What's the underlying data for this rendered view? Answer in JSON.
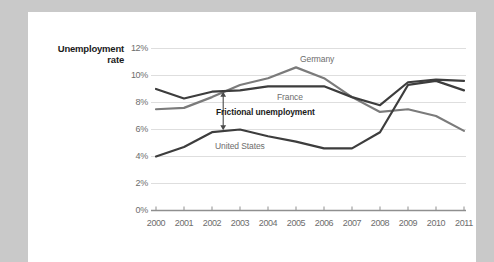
{
  "chart_data": {
    "type": "line",
    "title": "",
    "xlabel": "",
    "ylabel": "Unemployment rate",
    "ylim": [
      0,
      12
    ],
    "ytick_labels": [
      "0%",
      "2%",
      "4%",
      "6%",
      "8%",
      "10%",
      "12%"
    ],
    "ytick_values": [
      0,
      2,
      4,
      6,
      8,
      10,
      12
    ],
    "grid": true,
    "legend_position": "inline-labels",
    "x": [
      2000,
      2001,
      2002,
      2003,
      2004,
      2005,
      2006,
      2007,
      2008,
      2009,
      2010,
      2011
    ],
    "xtick_labels": [
      "2000",
      "2001",
      "2002",
      "2003",
      "2004",
      "2005",
      "2006",
      "2007",
      "2008",
      "2009",
      "2010",
      "2011"
    ],
    "series": [
      {
        "name": "France",
        "color": "#3d3d3d",
        "values": [
          9.0,
          8.3,
          8.8,
          8.9,
          9.2,
          9.2,
          9.2,
          8.4,
          7.8,
          9.5,
          9.7,
          9.6
        ]
      },
      {
        "name": "Germany",
        "color": "#7b7b7b",
        "values": [
          7.5,
          7.6,
          8.4,
          9.3,
          9.8,
          10.6,
          9.8,
          8.4,
          7.3,
          7.5,
          7.0,
          5.9
        ]
      },
      {
        "name": "United States",
        "color": "#3d3d3d",
        "values": [
          4.0,
          4.7,
          5.8,
          6.0,
          5.5,
          5.1,
          4.6,
          4.6,
          5.8,
          9.3,
          9.6,
          8.9
        ]
      }
    ],
    "annotations": [
      {
        "text": "Frictional unemployment",
        "type": "double-arrow-bracket",
        "x": 2002.4,
        "y_top": 8.8,
        "y_bottom": 5.95
      }
    ],
    "series_inline_labels": [
      {
        "name": "Germany",
        "text": "Germany"
      },
      {
        "name": "France",
        "text": "France"
      },
      {
        "name": "United States",
        "text": "United States"
      }
    ]
  },
  "colors": {
    "page_background": "#c9c9c9",
    "card_background": "#ffffff",
    "grid": "#dcdcdc",
    "axis": "#8c8c8c",
    "tick_text": "#6d6d6d",
    "label_text": "#1b1b1b",
    "series_dark": "#3d3d3d",
    "series_gray": "#7b7b7b"
  }
}
